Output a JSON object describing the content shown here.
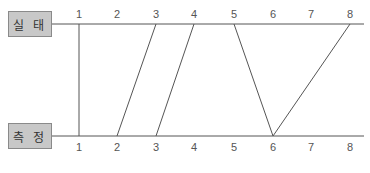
{
  "top_row": {
    "label": "실 태",
    "ticks": [
      "1",
      "2",
      "3",
      "4",
      "5",
      "6",
      "7",
      "8"
    ]
  },
  "bottom_row": {
    "label": "측 정",
    "ticks": [
      "1",
      "2",
      "3",
      "4",
      "5",
      "6",
      "7",
      "8"
    ]
  },
  "mappings": [
    {
      "from": 1,
      "to": 1
    },
    {
      "from": 3,
      "to": 2
    },
    {
      "from": 4,
      "to": 3
    },
    {
      "from": 5,
      "to": 6
    },
    {
      "from": 8,
      "to": 6
    }
  ],
  "colors": {
    "line": "#555555",
    "box_fill": "#c8c8c8",
    "box_border": "#8a8a8a"
  }
}
